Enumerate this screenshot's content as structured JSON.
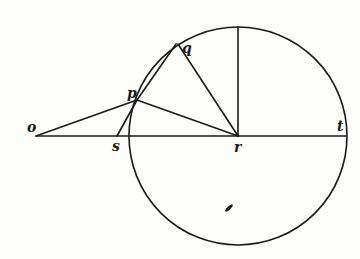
{
  "diagram": {
    "type": "geometry-circle-construction",
    "stroke_color": "#1a1a1a",
    "background": "#fdfdfb",
    "circle": {
      "center": "r",
      "cx": 238,
      "cy": 136,
      "radius": 109
    },
    "points": {
      "o": {
        "label": "o",
        "x": 36,
        "y": 136
      },
      "s": {
        "label": "s",
        "x": 117,
        "y": 136
      },
      "r": {
        "label": "r",
        "x": 238,
        "y": 136
      },
      "t": {
        "label": "t",
        "x": 346,
        "y": 136
      },
      "p": {
        "label": "p",
        "x": 137,
        "y": 100
      },
      "q": {
        "label": "q",
        "x": 178,
        "y": 44
      },
      "top": {
        "label": "",
        "x": 238,
        "y": 27
      }
    },
    "segments": [
      [
        "o",
        "t"
      ],
      [
        "o",
        "p"
      ],
      [
        "p",
        "r"
      ],
      [
        "p",
        "s"
      ],
      [
        "p",
        "q"
      ],
      [
        "q",
        "r"
      ],
      [
        "r",
        "top"
      ]
    ]
  }
}
